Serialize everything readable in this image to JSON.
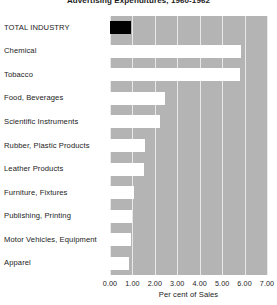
{
  "chart_data": {
    "type": "bar",
    "orientation": "horizontal",
    "title": "Advertising Expenditures, 1960-1962",
    "xlabel": "Per cent of Sales",
    "ylabel": "",
    "xlim": [
      0.0,
      7.0
    ],
    "xticks": [
      0.0,
      1.0,
      2.0,
      3.0,
      4.0,
      5.0,
      6.0,
      7.0
    ],
    "xtick_labels": [
      "0.00",
      "1.00",
      "2.00",
      "3.00",
      "4.00",
      "5.00",
      "6.00",
      "7.00"
    ],
    "grid": true,
    "grid_axis": "x",
    "legend": null,
    "categories": [
      "TOTAL INDUSTRY",
      "Chemical",
      "Tobacco",
      "Food, Beverages",
      "Scientific Instruments",
      "Rubber, Plastic Products",
      "Leather Products",
      "Furniture, Fixtures",
      "Publishing, Printing",
      "Motor Vehicles, Equipment",
      "Apparel"
    ],
    "values": [
      0.95,
      5.85,
      5.8,
      2.45,
      2.25,
      1.55,
      1.5,
      1.05,
      1.0,
      0.95,
      0.85
    ],
    "bar_colors": [
      "#000000",
      "#ffffff",
      "#ffffff",
      "#ffffff",
      "#ffffff",
      "#ffffff",
      "#ffffff",
      "#ffffff",
      "#ffffff",
      "#ffffff",
      "#ffffff"
    ],
    "plot_background": "#b4b4b4",
    "gridline_color": "#e8e8e8",
    "text_color": "#1b1b1b"
  }
}
